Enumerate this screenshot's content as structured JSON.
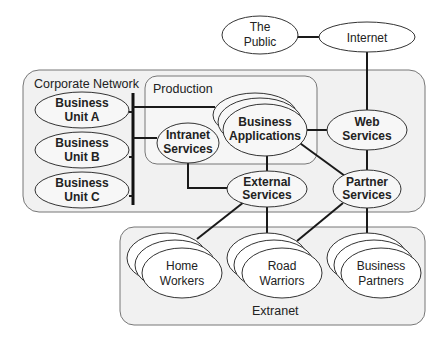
{
  "diagram": {
    "groups": {
      "corporate": {
        "label": "Corporate Network"
      },
      "production": {
        "label": "Production"
      },
      "extranet": {
        "label": "Extranet"
      }
    },
    "nodes": {
      "public": {
        "line1": "The",
        "line2": "Public"
      },
      "internet": {
        "line1": "Internet"
      },
      "unit_a": {
        "line1": "Business",
        "line2": "Unit A"
      },
      "unit_b": {
        "line1": "Business",
        "line2": "Unit B"
      },
      "unit_c": {
        "line1": "Business",
        "line2": "Unit C"
      },
      "intranet": {
        "line1": "Intranet",
        "line2": "Services"
      },
      "apps": {
        "line1": "Business",
        "line2": "Applications"
      },
      "web": {
        "line1": "Web",
        "line2": "Services"
      },
      "external": {
        "line1": "External",
        "line2": "Services"
      },
      "partner": {
        "line1": "Partner",
        "line2": "Services"
      },
      "home": {
        "line1": "Home",
        "line2": "Workers"
      },
      "road": {
        "line1": "Road",
        "line2": "Warriors"
      },
      "partners": {
        "line1": "Business",
        "line2": "Partners"
      }
    },
    "edges": [
      [
        "The Public",
        "Internet"
      ],
      [
        "Internet",
        "Web Services"
      ],
      [
        "Business Applications",
        "Web Services"
      ],
      [
        "Corporate bus",
        "Business Unit A"
      ],
      [
        "Corporate bus",
        "Business Unit B"
      ],
      [
        "Corporate bus",
        "Business Unit C"
      ],
      [
        "Corporate bus",
        "Business Applications"
      ],
      [
        "Corporate bus",
        "Intranet Services"
      ],
      [
        "Intranet Services",
        "External Services"
      ],
      [
        "Business Applications",
        "External Services"
      ],
      [
        "Business Applications",
        "Partner Services"
      ],
      [
        "Web Services",
        "Partner Services"
      ],
      [
        "External Services",
        "Home Workers"
      ],
      [
        "External Services",
        "Road Warriors"
      ],
      [
        "Partner Services",
        "Road Warriors"
      ],
      [
        "Partner Services",
        "Business Partners"
      ]
    ]
  }
}
